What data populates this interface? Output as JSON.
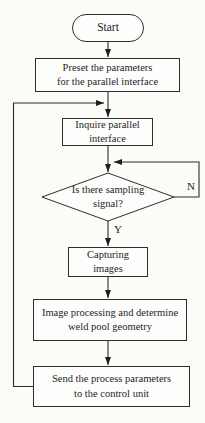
{
  "figure": {
    "background_color": "#fbfbf8",
    "line_color": "#2c2c2c",
    "node_fill_color": "#fdfdfc",
    "text_color": "#1e1e1e"
  },
  "flowchart": {
    "nodes": {
      "start": {
        "type": "terminator",
        "label": "Start"
      },
      "preset": {
        "type": "process",
        "label": "Preset the parameters\nfor the parallel interface"
      },
      "inquire": {
        "type": "process",
        "label": "Inquire parallel\ninterface"
      },
      "sampling_decision": {
        "type": "decision",
        "label": "Is there sampling\nsignal?"
      },
      "capture": {
        "type": "process",
        "label": "Capturing\nimages"
      },
      "processing": {
        "type": "process",
        "label": "Image processing and determine\nweld pool geometry"
      },
      "send": {
        "type": "process",
        "label": "Send the process parameters\nto the control unit"
      }
    },
    "branch_labels": {
      "no": "N",
      "yes": "Y"
    }
  }
}
